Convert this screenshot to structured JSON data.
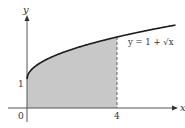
{
  "chart_data": {
    "type": "area",
    "title": "",
    "function": "y = 1 + √x",
    "curve_label": "y = 1 + √x",
    "xlabel": "x",
    "ylabel": "y",
    "x_ticks": [
      "0",
      "4"
    ],
    "y_ticks": [
      "1"
    ],
    "shaded_region": {
      "x_from": 0,
      "x_to": 4,
      "under": "y = 1 + √x"
    },
    "x": [
      0,
      0.25,
      1,
      2,
      3,
      4,
      5,
      6
    ],
    "values": [
      1,
      1.5,
      2,
      2.414,
      2.732,
      3,
      3.236,
      3.449
    ],
    "colors": {
      "curve": "#1a1a1a",
      "fill": "#c8c8c8",
      "axes": "#555555",
      "dashed": "#666666"
    }
  },
  "labels": {
    "x_axis": "x",
    "y_axis": "y",
    "origin": "0",
    "tick_y1": "1",
    "tick_x4": "4",
    "curve": "y = 1 + √x"
  }
}
